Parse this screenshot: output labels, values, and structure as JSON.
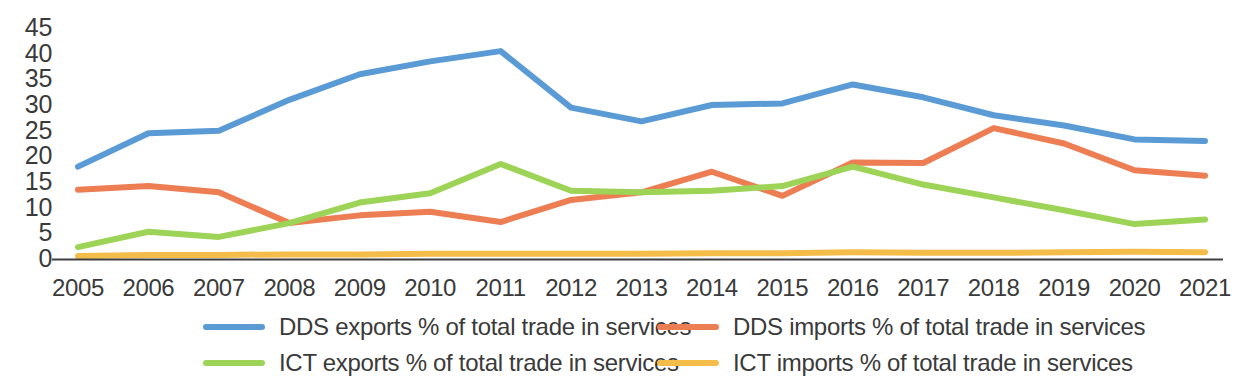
{
  "chart_data": {
    "type": "line",
    "title": "",
    "subtitle": "",
    "xlabel": "",
    "ylabel": "",
    "categories": [
      "2005",
      "2006",
      "2007",
      "2008",
      "2009",
      "2010",
      "2011",
      "2012",
      "2013",
      "2014",
      "2015",
      "2016",
      "2017",
      "2018",
      "2019",
      "2020",
      "2021"
    ],
    "ylim": [
      0,
      45
    ],
    "yticks": [
      "0",
      "5",
      "10",
      "15",
      "20",
      "25",
      "30",
      "35",
      "40",
      "45"
    ],
    "grid": false,
    "legend_position": "bottom",
    "series": [
      {
        "name": "DDS exports % of total trade in services",
        "color": "#5b9bd5",
        "values": [
          18.0,
          24.5,
          25.0,
          31.0,
          36.0,
          38.5,
          40.5,
          29.5,
          26.8,
          30.0,
          30.3,
          34.0,
          31.5,
          28.0,
          26.0,
          23.3,
          23.0
        ]
      },
      {
        "name": "DDS imports % of total trade in services",
        "color": "#ed7d52",
        "values": [
          13.5,
          14.2,
          13.0,
          7.0,
          8.5,
          9.2,
          7.2,
          11.5,
          13.0,
          17.0,
          12.3,
          18.8,
          18.7,
          25.5,
          22.5,
          17.3,
          16.2
        ]
      },
      {
        "name": "ICT exports % of total trade in services",
        "color": "#9dd356",
        "values": [
          2.3,
          5.3,
          4.3,
          7.0,
          11.0,
          12.8,
          18.5,
          13.3,
          13.0,
          13.3,
          14.2,
          18.0,
          14.5,
          12.0,
          9.5,
          6.8,
          7.7
        ]
      },
      {
        "name": "ICT imports % of total trade in services",
        "color": "#f4bd4a",
        "values": [
          0.6,
          0.8,
          0.8,
          0.9,
          0.9,
          1.0,
          1.0,
          1.0,
          1.0,
          1.1,
          1.1,
          1.3,
          1.2,
          1.2,
          1.3,
          1.4,
          1.3
        ]
      }
    ]
  },
  "axes": {
    "y_ticks": [
      "45",
      "40",
      "35",
      "30",
      "25",
      "20",
      "15",
      "10",
      "5",
      "0"
    ],
    "x_ticks": [
      "2005",
      "2006",
      "2007",
      "2008",
      "2009",
      "2010",
      "2011",
      "2012",
      "2013",
      "2014",
      "2015",
      "2016",
      "2017",
      "2018",
      "2019",
      "2020",
      "2021"
    ]
  },
  "legend": {
    "items": [
      {
        "label": "DDS exports % of total trade in services",
        "color": "#5b9bd5"
      },
      {
        "label": "DDS imports % of total trade in services",
        "color": "#ed7d52"
      },
      {
        "label": "ICT exports % of total trade in services",
        "color": "#9dd356"
      },
      {
        "label": "ICT imports % of total trade in services",
        "color": "#f4bd4a"
      }
    ]
  }
}
